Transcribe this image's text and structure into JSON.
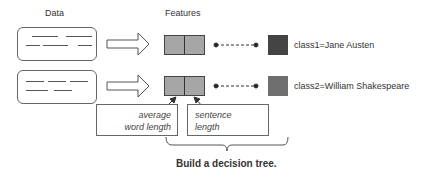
{
  "headers": {
    "data": "Data",
    "features": "Features"
  },
  "rows": [
    {
      "data_icon": "text-document-icon",
      "arrow_icon": "right-arrow-icon",
      "feature_cells": [
        "average word length",
        "sentence length"
      ],
      "class_label": "class1=Jane Austen",
      "class_color": "#444444"
    },
    {
      "data_icon": "text-document-icon",
      "arrow_icon": "right-arrow-icon",
      "feature_cells": [
        "average word length",
        "sentence length"
      ],
      "class_label": "class2=William Shakespeare",
      "class_color": "#6e6e6e"
    }
  ],
  "feature_labels": {
    "left": [
      "average",
      "word length"
    ],
    "right": [
      "sentence",
      "length"
    ]
  },
  "colors": {
    "feature_fill": "#a6a6a6",
    "outline": "#666666"
  },
  "caption": "Build a decision tree."
}
